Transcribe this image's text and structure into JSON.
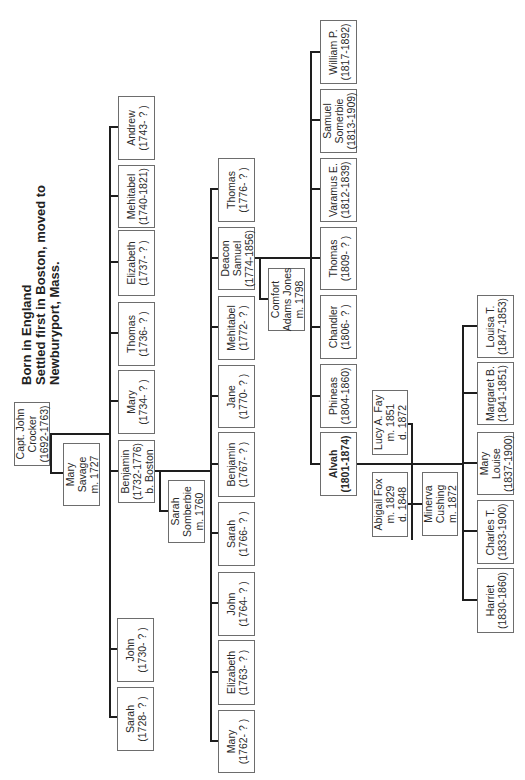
{
  "title": {
    "lines": [
      "Born in England",
      "Settled first in Boston, moved to",
      "Newburyport, Mass."
    ]
  },
  "people": {
    "john_crocker": {
      "lines": [
        "Capt. John",
        "Crocker",
        "(1692-1763)"
      ]
    },
    "mary_savage": {
      "lines": [
        "Mary",
        "Savage",
        "m. 1727"
      ]
    },
    "gen2": [
      {
        "lines": [
          "Sarah",
          "(1728-  ?  )"
        ]
      },
      {
        "lines": [
          "John",
          "(1730-  ?  )"
        ]
      },
      {
        "lines": [
          "Benjamin",
          "(1732-1776)",
          "b. Boston"
        ]
      },
      {
        "lines": [
          "Mary",
          "(1734-  ?  )"
        ]
      },
      {
        "lines": [
          "Thomas",
          "(1736-  ?  )"
        ]
      },
      {
        "lines": [
          "Elizabeth",
          "(1737-  ?  )"
        ]
      },
      {
        "lines": [
          "Mehitabel",
          "(1740-1821)"
        ]
      },
      {
        "lines": [
          "Andrew",
          "(1743-  ?  )"
        ]
      }
    ],
    "sarah_somberbie": {
      "lines": [
        "Sarah",
        "Somberbie",
        "m. 1760"
      ]
    },
    "gen3": [
      {
        "lines": [
          "Mary",
          "(1762-  ?  )"
        ]
      },
      {
        "lines": [
          "Elizabeth",
          "(1763-  ?  )"
        ]
      },
      {
        "lines": [
          "John",
          "(1764-  ?  )"
        ]
      },
      {
        "lines": [
          "Sarah",
          "(1766-  ?  )"
        ]
      },
      {
        "lines": [
          "Benjamin",
          "(1767-  ?  )"
        ]
      },
      {
        "lines": [
          "Jane",
          "(1770-  ?  )"
        ]
      },
      {
        "lines": [
          "Mehitabel",
          "(1772-  ?  )"
        ]
      },
      {
        "lines": [
          "Deacon",
          "Samuel",
          "(1774-1856)"
        ]
      },
      {
        "lines": [
          "Thomas",
          "(1776-  ?  )"
        ]
      }
    ],
    "comfort_adams_jones": {
      "lines": [
        "Comfort",
        "Adams Jones",
        "m. 1798"
      ]
    },
    "gen4": [
      {
        "lines": [
          "Alvah",
          "(1801-1874)"
        ],
        "bold": true
      },
      {
        "lines": [
          "Phineas",
          "(1804-1860)"
        ]
      },
      {
        "lines": [
          "Chandler",
          "(1806-  ?  )"
        ]
      },
      {
        "lines": [
          "Thomas",
          "(1809-  ?  )"
        ]
      },
      {
        "lines": [
          "Varamus E.",
          "(1812-1839)"
        ]
      },
      {
        "lines": [
          "Samuel",
          "Somerbie",
          "(1813-1909)"
        ]
      },
      {
        "lines": [
          "William P.",
          "(1817-1892)"
        ]
      }
    ],
    "lucy_fay": {
      "lines": [
        "Lucy A. Fay",
        "m. 1851",
        "d. 1872"
      ]
    },
    "abigail_fox": {
      "lines": [
        "Abigail Fox",
        "m. 1829",
        "d. 1848"
      ]
    },
    "minerva_cushing": {
      "lines": [
        "Minerva",
        "Cushing",
        "m. 1872"
      ]
    },
    "gen5": [
      {
        "lines": [
          "Harriet",
          "(1830-1860)"
        ]
      },
      {
        "lines": [
          "Charles T.",
          "(1833-1900)"
        ]
      },
      {
        "lines": [
          "Mary",
          "Louise",
          "(1837-1900)"
        ]
      },
      {
        "lines": [
          "Margaret B.",
          "(1841-1851)"
        ]
      },
      {
        "lines": [
          "Louisa T.",
          "(1847-1853)"
        ]
      }
    ]
  }
}
